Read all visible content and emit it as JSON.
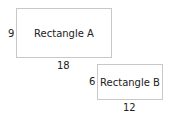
{
  "rectangles": [
    {
      "label": "Rectangle A",
      "height_label": "9",
      "width_label": "18"
    },
    {
      "label": "Rectangle B",
      "height_label": "6",
      "width_label": "12"
    }
  ],
  "colors": {
    "border": "#c8c8c8",
    "text": "#222222"
  }
}
